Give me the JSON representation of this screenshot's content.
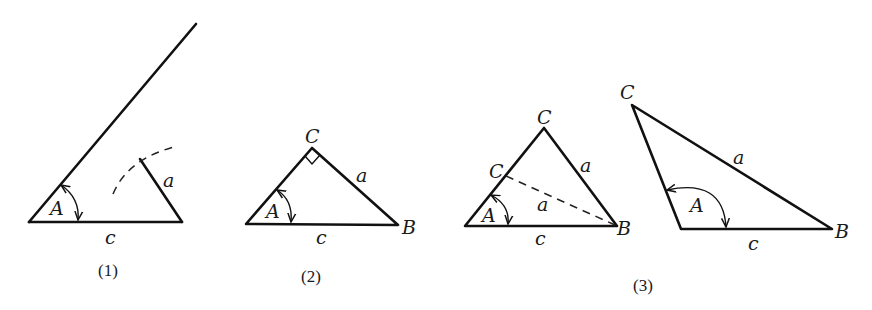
{
  "figures": [
    {
      "caption": "(1)",
      "labels": {
        "angle": "A",
        "side_a": "a",
        "side_c": "c"
      }
    },
    {
      "caption": "(2)",
      "labels": {
        "angle": "A",
        "vertex_C": "C",
        "vertex_B": "B",
        "side_a": "a",
        "side_c": "c"
      }
    },
    {
      "caption": "(3)",
      "left": {
        "labels": {
          "angle": "A",
          "vertex_C_top": "C",
          "vertex_C_alt": "C",
          "vertex_B": "B",
          "side_a_right": "a",
          "side_a_dashed": "a",
          "side_c": "c"
        }
      },
      "right": {
        "labels": {
          "angle": "A",
          "vertex_C": "C",
          "vertex_B": "B",
          "side_a": "a",
          "side_c": "c"
        }
      }
    }
  ],
  "colors": {
    "ink": "#111111",
    "background": "#ffffff"
  }
}
